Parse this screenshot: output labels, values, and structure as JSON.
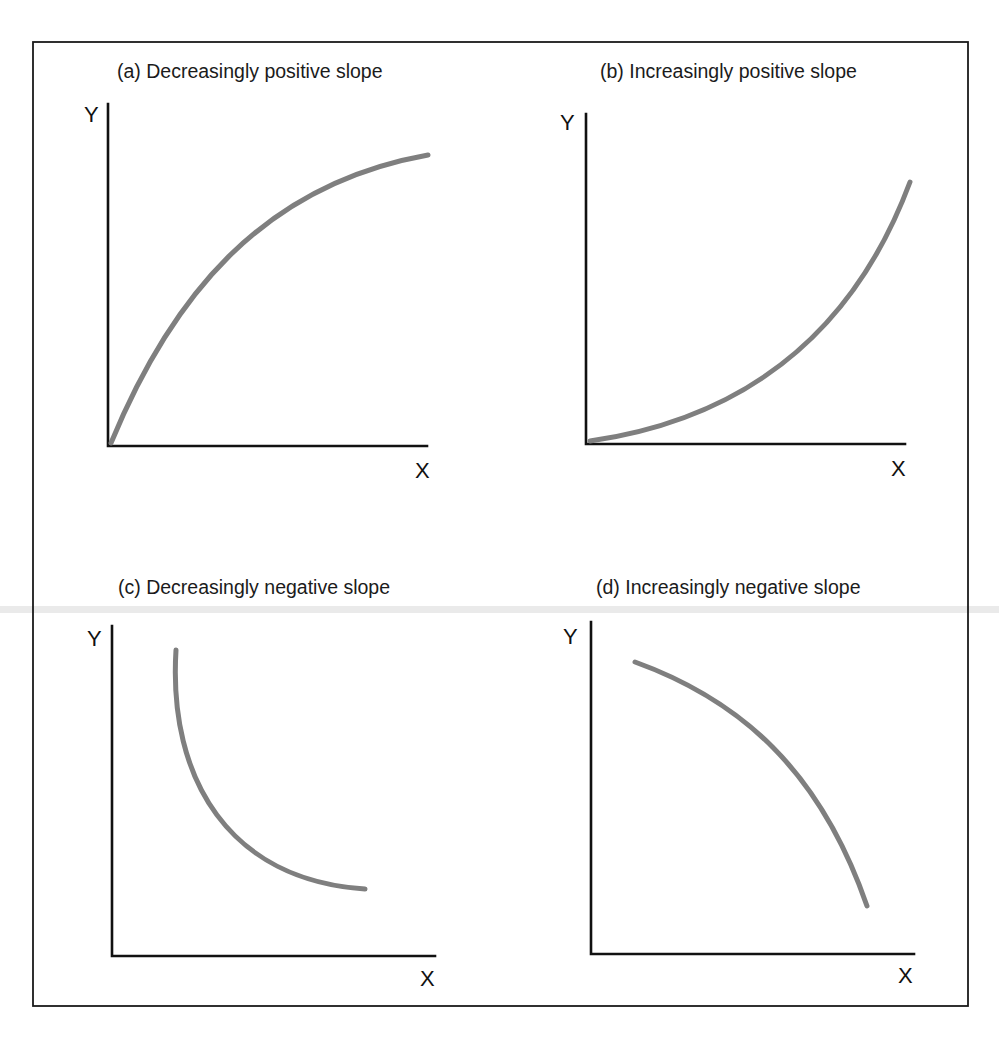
{
  "figure": {
    "panels": [
      {
        "id": "a",
        "title": "(a) Decreasingly positive slope",
        "y_label": "Y",
        "x_label": "X"
      },
      {
        "id": "b",
        "title": "(b) Increasingly positive slope",
        "y_label": "Y",
        "x_label": "X"
      },
      {
        "id": "c",
        "title": "(c) Decreasingly negative slope",
        "y_label": "Y",
        "x_label": "X"
      },
      {
        "id": "d",
        "title": "(d) Increasingly negative slope",
        "y_label": "Y",
        "x_label": "X"
      }
    ],
    "colors": {
      "curve": "#7f7f7f",
      "axes": "#111111",
      "frame": "#1a1a1a",
      "background": "#ffffff"
    }
  }
}
